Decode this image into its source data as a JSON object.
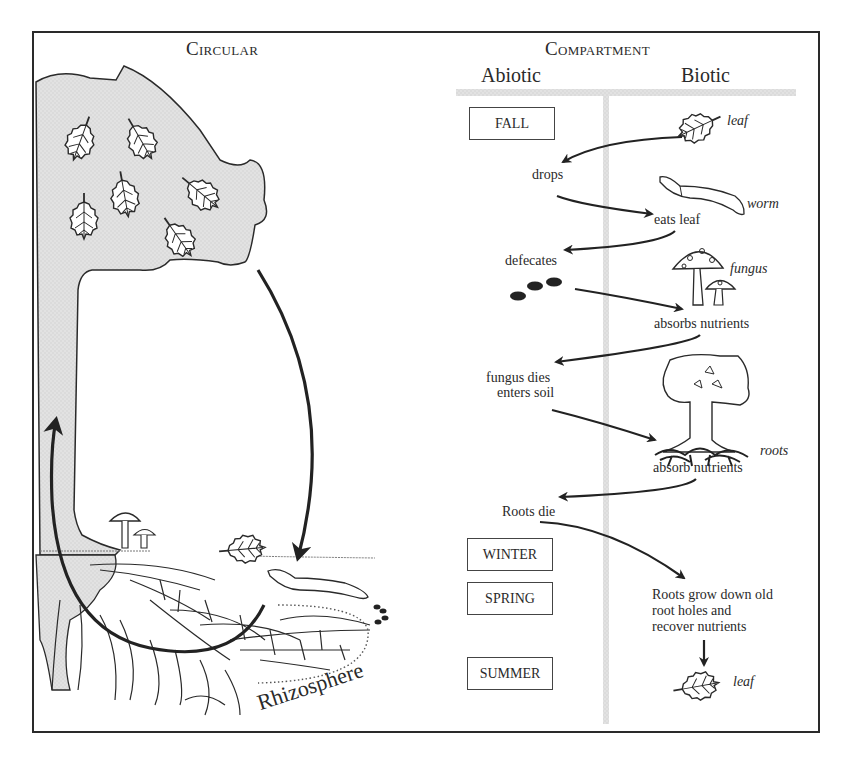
{
  "left_panel": {
    "title": "Circular",
    "region_label": "Rhizosphere"
  },
  "right_panel": {
    "title": "Compartment",
    "columns": {
      "abiotic": "Abiotic",
      "biotic": "Biotic"
    },
    "seasons": [
      {
        "label": "FALL"
      },
      {
        "label": "WINTER"
      },
      {
        "label": "SPRING"
      },
      {
        "label": "SUMMER"
      }
    ],
    "biotic_labels": {
      "leaf_top": "leaf",
      "worm": "worm",
      "fungus": "fungus",
      "roots": "roots",
      "leaf_bottom": "leaf"
    },
    "steps": [
      {
        "id": "drops",
        "text": "drops"
      },
      {
        "id": "eats_leaf",
        "text": "eats leaf"
      },
      {
        "id": "defecates",
        "text": "defecates"
      },
      {
        "id": "absorbs_nutrients",
        "text": "absorbs nutrients"
      },
      {
        "id": "fungus_dies_1",
        "text": "fungus dies"
      },
      {
        "id": "fungus_dies_2",
        "text": "enters soil"
      },
      {
        "id": "absorb_nutrients",
        "text": "absorb nutrients"
      },
      {
        "id": "roots_die",
        "text": "Roots die"
      },
      {
        "id": "roots_grow_1",
        "text": "Roots grow down old"
      },
      {
        "id": "roots_grow_2",
        "text": "root holes and"
      },
      {
        "id": "roots_grow_3",
        "text": "recover nutrients"
      }
    ]
  },
  "colors": {
    "ink": "#2a2a2a",
    "tree_fill": "#dcdcdc",
    "divider": "#c8c8c8"
  }
}
